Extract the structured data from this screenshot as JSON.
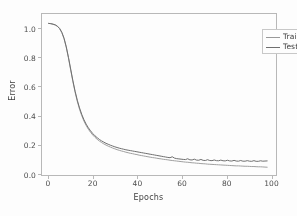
{
  "chart_data": {
    "type": "line",
    "title": "",
    "xlabel": "Epochs",
    "ylabel": "Error",
    "xlim": [
      -3,
      103
    ],
    "ylim": [
      -0.03,
      1.17
    ],
    "xticks": [
      0,
      20,
      40,
      60,
      80,
      100
    ],
    "xticklabels": [
      "0",
      "20",
      "40",
      "60",
      "80",
      "100"
    ],
    "yticks": [
      0.0,
      0.2,
      0.4,
      0.6,
      0.8,
      1.0
    ],
    "yticklabels": [
      "0.0",
      "0.2",
      "0.4",
      "0.6",
      "0.8",
      "1.0"
    ],
    "grid": false,
    "legend_position": "upper right",
    "colors": {
      "train": "#a0a0a0",
      "test": "#6f6f6f",
      "frame": "#b9b9b9"
    },
    "x": [
      0,
      1,
      2,
      3,
      4,
      5,
      6,
      7,
      8,
      9,
      10,
      11,
      12,
      13,
      14,
      15,
      16,
      17,
      18,
      19,
      20,
      21,
      22,
      23,
      24,
      25,
      26,
      27,
      28,
      29,
      30,
      31,
      32,
      33,
      34,
      35,
      36,
      37,
      38,
      39,
      40,
      41,
      42,
      43,
      44,
      45,
      46,
      47,
      48,
      49,
      50,
      51,
      52,
      53,
      54,
      55,
      56,
      57,
      58,
      59,
      60,
      61,
      62,
      63,
      64,
      65,
      66,
      67,
      68,
      69,
      70,
      71,
      72,
      73,
      74,
      75,
      76,
      77,
      78,
      79,
      80,
      81,
      82,
      83,
      84,
      85,
      86,
      87,
      88,
      89,
      90,
      91,
      92,
      93,
      94,
      95,
      96,
      97,
      98,
      99
    ],
    "series": [
      {
        "name": "Train",
        "color": "#a0a0a0",
        "values": [
          1.1,
          1.098,
          1.094,
          1.088,
          1.078,
          1.06,
          1.03,
          0.985,
          0.92,
          0.84,
          0.752,
          0.665,
          0.586,
          0.518,
          0.46,
          0.412,
          0.372,
          0.339,
          0.311,
          0.288,
          0.268,
          0.251,
          0.236,
          0.223,
          0.212,
          0.202,
          0.193,
          0.185,
          0.178,
          0.171,
          0.165,
          0.159,
          0.154,
          0.149,
          0.145,
          0.14,
          0.136,
          0.132,
          0.129,
          0.125,
          0.122,
          0.118,
          0.115,
          0.112,
          0.109,
          0.106,
          0.103,
          0.1,
          0.098,
          0.095,
          0.092,
          0.09,
          0.087,
          0.085,
          0.083,
          0.08,
          0.078,
          0.076,
          0.074,
          0.072,
          0.07,
          0.068,
          0.066,
          0.065,
          0.063,
          0.061,
          0.06,
          0.058,
          0.057,
          0.055,
          0.054,
          0.053,
          0.051,
          0.05,
          0.049,
          0.048,
          0.047,
          0.046,
          0.045,
          0.044,
          0.043,
          0.042,
          0.041,
          0.04,
          0.039,
          0.038,
          0.038,
          0.037,
          0.036,
          0.035,
          0.035,
          0.034,
          0.033,
          0.033,
          0.032,
          0.031,
          0.031,
          0.03,
          0.029,
          0.028
        ]
      },
      {
        "name": "Test",
        "color": "#6f6f6f",
        "values": [
          1.1,
          1.098,
          1.094,
          1.089,
          1.079,
          1.062,
          1.033,
          0.989,
          0.925,
          0.846,
          0.759,
          0.673,
          0.594,
          0.527,
          0.47,
          0.422,
          0.382,
          0.349,
          0.322,
          0.299,
          0.279,
          0.262,
          0.248,
          0.235,
          0.224,
          0.215,
          0.206,
          0.199,
          0.192,
          0.186,
          0.18,
          0.175,
          0.17,
          0.166,
          0.162,
          0.158,
          0.155,
          0.152,
          0.149,
          0.146,
          0.143,
          0.14,
          0.137,
          0.134,
          0.131,
          0.128,
          0.125,
          0.122,
          0.119,
          0.116,
          0.113,
          0.11,
          0.107,
          0.104,
          0.101,
          0.099,
          0.106,
          0.096,
          0.092,
          0.09,
          0.088,
          0.086,
          0.085,
          0.091,
          0.083,
          0.082,
          0.088,
          0.081,
          0.08,
          0.086,
          0.079,
          0.078,
          0.084,
          0.078,
          0.077,
          0.082,
          0.077,
          0.076,
          0.081,
          0.076,
          0.075,
          0.08,
          0.075,
          0.074,
          0.079,
          0.074,
          0.073,
          0.078,
          0.073,
          0.073,
          0.077,
          0.073,
          0.072,
          0.077,
          0.072,
          0.072,
          0.076,
          0.073,
          0.074,
          0.075
        ]
      }
    ],
    "legend": [
      {
        "label": "Train",
        "color": "#a0a0a0"
      },
      {
        "label": "Test",
        "color": "#6f6f6f"
      }
    ]
  }
}
